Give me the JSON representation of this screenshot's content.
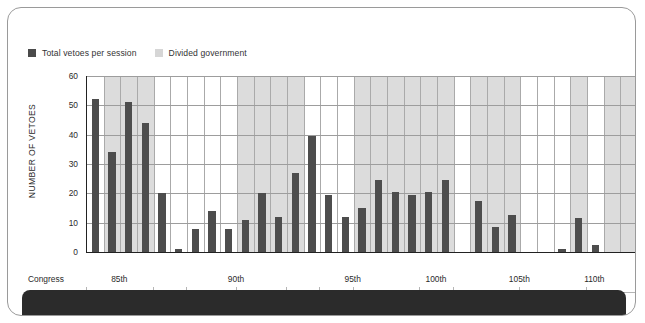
{
  "legend": {
    "items": [
      {
        "label": "Total vetoes per session",
        "swatch": "dark",
        "color": "#4a4a4a"
      },
      {
        "label": "Divided government",
        "swatch": "light",
        "color": "#d6d6d6"
      }
    ]
  },
  "axis_row_labels": {
    "congress": "Congress",
    "president": "President"
  },
  "chart_data": {
    "type": "bar",
    "title": "",
    "xlabel": "Congress",
    "ylabel": "NUMBER OF VETOES",
    "ylim": [
      0,
      60
    ],
    "yticks": [
      0,
      10,
      20,
      30,
      40,
      50,
      60
    ],
    "grid": true,
    "legend_position": "top-left",
    "series": [
      {
        "name": "Total vetoes per session",
        "color": "#4d4d4d",
        "values": [
          52,
          34,
          51,
          44,
          20,
          1,
          8,
          14,
          8,
          11,
          20,
          12,
          27,
          39.5,
          19.5,
          12,
          15,
          24.5,
          20.5,
          19.5,
          20.5,
          24.5,
          0,
          17.5,
          8.5,
          12.5,
          0,
          0,
          1,
          11.5,
          2.5,
          0,
          0
        ]
      }
    ],
    "shaded_series": {
      "name": "Divided government",
      "color": "#dcdcdc",
      "description": "Shaded background columns mark sessions of divided government",
      "flags": [
        0,
        1,
        1,
        1,
        0,
        0,
        0,
        0,
        0,
        1,
        1,
        1,
        1,
        0,
        0,
        0,
        1,
        1,
        1,
        1,
        1,
        1,
        0,
        1,
        1,
        1,
        0,
        0,
        0,
        1,
        0,
        1,
        1
      ]
    },
    "congress_ticks": [
      {
        "label": "85th",
        "index": 1.5
      },
      {
        "label": "90th",
        "index": 8.5
      },
      {
        "label": "95th",
        "index": 15.5
      },
      {
        "label": "100th",
        "index": 20.5
      },
      {
        "label": "105th",
        "index": 25.5
      },
      {
        "label": "110th",
        "index": 30.0
      }
    ],
    "president_segments": [
      {
        "label": "Eisenhower",
        "start": 0,
        "end": 4
      },
      {
        "label": "JFK",
        "start": 4,
        "end": 6
      },
      {
        "label": "Johnson",
        "start": 6,
        "end": 9
      },
      {
        "label": "Nixon",
        "start": 9,
        "end": 12
      },
      {
        "label": "Ford",
        "start": 12,
        "end": 14
      },
      {
        "label": "Carter",
        "start": 14,
        "end": 16
      },
      {
        "label": "Reagan",
        "start": 16,
        "end": 20
      },
      {
        "label": "Bush",
        "start": 20,
        "end": 22
      },
      {
        "label": "Clinton",
        "start": 22,
        "end": 26
      },
      {
        "label": "Bush",
        "start": 26,
        "end": 30
      },
      {
        "label": "Obama",
        "start": 30,
        "end": 33
      }
    ]
  }
}
